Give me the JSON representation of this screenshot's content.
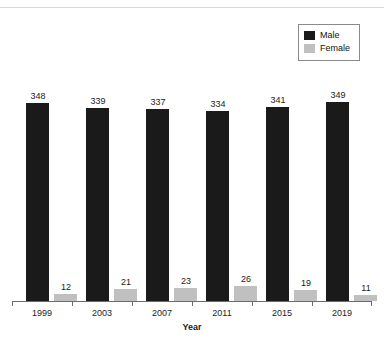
{
  "chart_data": {
    "type": "bar",
    "title": "",
    "subtitle": "",
    "xlabel": "Year",
    "ylabel": "",
    "categories": [
      "1999",
      "2003",
      "2007",
      "2011",
      "2015",
      "2019"
    ],
    "series": [
      {
        "name": "Male",
        "color": "#1a1a1a",
        "values": [
          348,
          339,
          337,
          334,
          341,
          349
        ]
      },
      {
        "name": "Female",
        "color": "#c0c0c0",
        "values": [
          12,
          21,
          23,
          26,
          19,
          11
        ]
      }
    ],
    "ylim": [
      0,
      360
    ],
    "grid": false,
    "show_value_labels": true,
    "legend_position": "top-right",
    "axis_color": "#6b6b6b"
  },
  "legend": {
    "entries": [
      {
        "label": "Male",
        "swatch": "#1a1a1a"
      },
      {
        "label": "Female",
        "swatch": "#c0c0c0"
      }
    ]
  }
}
